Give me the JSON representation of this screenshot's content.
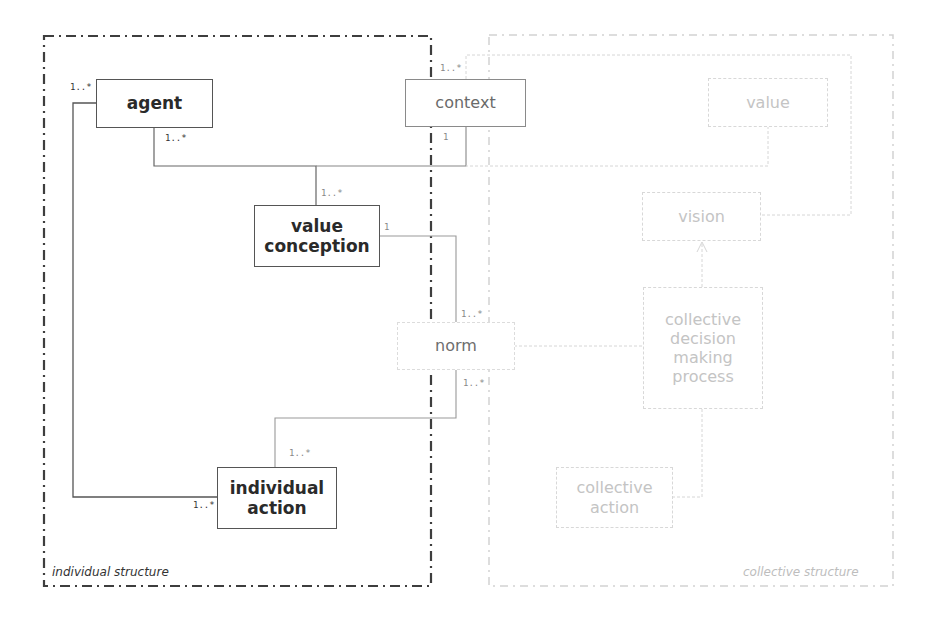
{
  "diagram": {
    "type": "uml-class-diagram",
    "frames": [
      {
        "id": "individual",
        "label": "individual structure",
        "color": "#444444"
      },
      {
        "id": "collective",
        "label": "collective structure",
        "color": "#cccccc"
      }
    ],
    "nodes": {
      "agent": {
        "label": "agent"
      },
      "value_conception": {
        "label": "value\nconception"
      },
      "individual_action": {
        "label": "individual\naction"
      },
      "context": {
        "label": "context"
      },
      "norm": {
        "label": "norm"
      },
      "value": {
        "label": "value"
      },
      "vision": {
        "label": "vision"
      },
      "collective_decision": {
        "label": "collective\ndecision\nmaking\nprocess"
      },
      "collective_action": {
        "label": "collective\naction"
      }
    },
    "multiplicities": {
      "agent_left": "1..*",
      "agent_bottom": "1..*",
      "value_conception_top": "1..*",
      "value_conception_right": "1",
      "context_top": "1..*",
      "context_bottom": "1",
      "norm_top": "1..*",
      "norm_bottom": "1..*",
      "individual_action_top": "1..*",
      "individual_action_left": "1..*"
    },
    "edges": [
      {
        "from": "agent",
        "to": "individual_action",
        "from_mult": "1..*",
        "to_mult": "1..*"
      },
      {
        "from": "agent",
        "to": "value_conception",
        "from_mult": "1..*",
        "to_mult": "1..*"
      },
      {
        "from": "context",
        "to": "value_conception",
        "from_mult": "1",
        "to_mult": "1..*"
      },
      {
        "from": "value_conception",
        "to": "norm",
        "from_mult": "1",
        "to_mult": "1..*"
      },
      {
        "from": "norm",
        "to": "individual_action",
        "from_mult": "1..*",
        "to_mult": "1..*"
      },
      {
        "from": "context",
        "to": "vision",
        "from_mult": "1..*",
        "to_mult": ""
      },
      {
        "from": "value",
        "to": "context",
        "from_mult": "",
        "to_mult": ""
      },
      {
        "from": "norm",
        "to": "collective_decision",
        "from_mult": "",
        "to_mult": ""
      },
      {
        "from": "collective_decision",
        "to": "vision",
        "arrow": true
      },
      {
        "from": "collective_action",
        "to": "collective_decision",
        "from_mult": "",
        "to_mult": ""
      }
    ]
  }
}
